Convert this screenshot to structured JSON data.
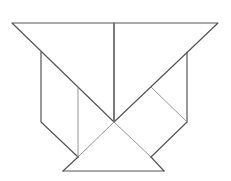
{
  "diagram": {
    "colors": {
      "background": "#ffffff",
      "outline": "#555555",
      "inner_line": "#8a8a8a"
    },
    "vertices": {
      "top_left": [
        12,
        23
      ],
      "top_mid": [
        114,
        23
      ],
      "top_right": [
        218,
        23
      ],
      "left_wall_top": [
        41,
        52
      ],
      "right_wall_top": [
        187,
        52
      ],
      "left_wall_bottom": [
        41,
        122
      ],
      "right_wall_bottom": [
        187,
        122
      ],
      "center": [
        114,
        122
      ],
      "left_inner_top": [
        78,
        87
      ],
      "right_inner": [
        151,
        87
      ],
      "left_foot": [
        78,
        157
      ],
      "right_foot": [
        151,
        157
      ],
      "base_left": [
        63,
        171
      ],
      "base_right": [
        164,
        171
      ]
    },
    "pieces": [
      {
        "name": "large-triangle-left",
        "points": [
          [
            12,
            23
          ],
          [
            114,
            23
          ],
          [
            114,
            122
          ]
        ]
      },
      {
        "name": "large-triangle-right",
        "points": [
          [
            114,
            23
          ],
          [
            218,
            23
          ],
          [
            114,
            122
          ]
        ]
      },
      {
        "name": "parallelogram-left",
        "points": [
          [
            41,
            52
          ],
          [
            78,
            87
          ],
          [
            78,
            157
          ],
          [
            41,
            122
          ]
        ]
      },
      {
        "name": "triangle-left-lower",
        "points": [
          [
            78,
            87
          ],
          [
            114,
            122
          ],
          [
            78,
            157
          ]
        ]
      },
      {
        "name": "square-right",
        "points": [
          [
            151,
            87
          ],
          [
            187,
            122
          ],
          [
            151,
            157
          ],
          [
            114,
            122
          ]
        ]
      },
      {
        "name": "triangle-right-wall",
        "points": [
          [
            187,
            52
          ],
          [
            187,
            122
          ],
          [
            151,
            87
          ]
        ]
      },
      {
        "name": "base-triangle",
        "points": [
          [
            63,
            171
          ],
          [
            164,
            171
          ],
          [
            114,
            122
          ]
        ]
      }
    ]
  }
}
